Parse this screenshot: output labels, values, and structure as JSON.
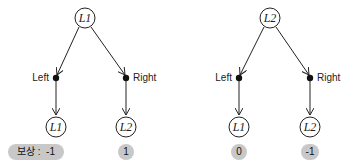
{
  "trees": [
    {
      "root": {
        "label": "L1"
      },
      "actions": [
        {
          "label": "Left",
          "next_state": "L1",
          "reward": "-1"
        },
        {
          "label": "Right",
          "next_state": "L2",
          "reward": "1"
        }
      ]
    },
    {
      "root": {
        "label": "L2"
      },
      "actions": [
        {
          "label": "Left",
          "next_state": "L1",
          "reward": "0"
        },
        {
          "label": "Right",
          "next_state": "L2",
          "reward": "-1"
        }
      ]
    }
  ],
  "reward_prefix": "보상 :",
  "colors": {
    "line": "#222222",
    "pill": "#c8c8c8"
  }
}
